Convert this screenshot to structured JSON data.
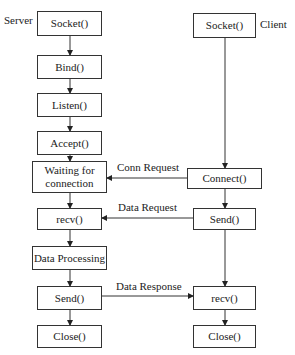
{
  "server": {
    "label": "Server",
    "steps": [
      "Socket()",
      "Bind()",
      "Listen()",
      "Accept()",
      "Waiting for connection",
      "recv()",
      "Data Processing",
      "Send()",
      "Close()"
    ]
  },
  "client": {
    "label": "Client",
    "steps": [
      "Socket()",
      "Connect()",
      "Send()",
      "recv()",
      "Close()"
    ]
  },
  "messages": [
    {
      "label": "Conn Request",
      "from": "Connect()",
      "to": "Waiting for connection"
    },
    {
      "label": "Data Request",
      "from": "Send()",
      "to": "recv()"
    },
    {
      "label": "Data Response",
      "from": "Send()",
      "to": "recv()"
    }
  ]
}
